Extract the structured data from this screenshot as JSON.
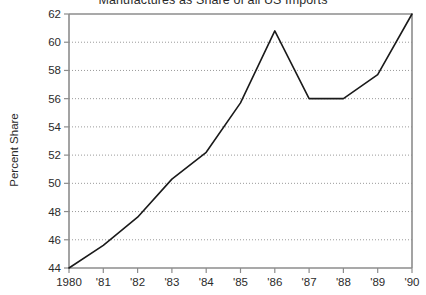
{
  "chart_data": {
    "type": "line",
    "title": "Manufactures as Share of all US Imports",
    "xlabel": "",
    "ylabel": "Percent Share",
    "x": [
      1980,
      1981,
      1982,
      1983,
      1984,
      1985,
      1986,
      1987,
      1988,
      1989,
      1990
    ],
    "xtick_labels": [
      "1980",
      "'81",
      "'82",
      "'83",
      "'84",
      "'85",
      "'86",
      "'87",
      "'88",
      "'89",
      "'90"
    ],
    "values": [
      44.0,
      45.6,
      47.6,
      50.3,
      52.2,
      55.7,
      60.8,
      56.0,
      56.0,
      57.7,
      62.0
    ],
    "ytick_labels": [
      "44",
      "46",
      "48",
      "50",
      "52",
      "54",
      "56",
      "58",
      "60",
      "62"
    ],
    "yticks": [
      44,
      46,
      48,
      50,
      52,
      54,
      56,
      58,
      60,
      62
    ],
    "ylim": [
      44,
      62
    ],
    "xlim": [
      1980,
      1990
    ],
    "grid": "horizontal-dotted",
    "legend": "none",
    "line_color": "#1a1a1a",
    "grid_color": "#9a9a9a",
    "axis_color": "#8c8c8c",
    "background_color": "#ffffff"
  }
}
